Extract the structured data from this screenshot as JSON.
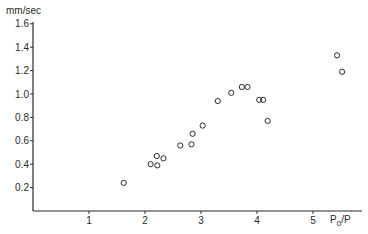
{
  "chart_data": {
    "type": "scatter",
    "title": "",
    "xlabel": "P0/P",
    "xlabel_main": "P",
    "xlabel_sub": "0",
    "xlabel_tail": "/P",
    "ylabel": "mm/sec",
    "xlim": [
      0,
      5.8
    ],
    "ylim": [
      0,
      1.6
    ],
    "grid": false,
    "legend": null,
    "x_ticks": [
      1,
      2,
      3,
      4,
      5
    ],
    "x_tick_labels": [
      "1",
      "2",
      "3",
      "4",
      "5"
    ],
    "y_ticks": [
      0.2,
      0.4,
      0.6,
      0.8,
      1.0,
      1.2,
      1.4,
      1.6
    ],
    "y_tick_labels": [
      "0.2",
      "0.4",
      "0.6",
      "0.8",
      "1.0",
      "1.2",
      "1.4",
      "1.6"
    ],
    "marker": "open-circle",
    "series": [
      {
        "name": "measurements",
        "x": [
          1.62,
          2.1,
          2.22,
          2.21,
          2.33,
          2.63,
          2.83,
          2.85,
          3.03,
          3.3,
          3.54,
          3.73,
          3.83,
          4.04,
          4.11,
          4.19,
          5.43,
          5.52
        ],
        "y": [
          0.24,
          0.4,
          0.39,
          0.47,
          0.45,
          0.56,
          0.57,
          0.66,
          0.73,
          0.94,
          1.01,
          1.06,
          1.06,
          0.95,
          0.95,
          0.77,
          1.33,
          1.19
        ]
      }
    ]
  },
  "colors": {
    "axis": "#2a2a2a",
    "marker": "#2a2a2a",
    "background": "#ffffff"
  }
}
